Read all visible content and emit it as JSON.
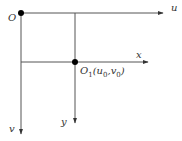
{
  "diagram": {
    "type": "coordinate-systems",
    "colors": {
      "axis": "#555555",
      "point": "#000000",
      "label": "#333333"
    },
    "labels": {
      "origin_O": "O",
      "axis_u": "u",
      "axis_v": "v",
      "axis_x": "x",
      "axis_y": "y",
      "origin_O1_main": "O",
      "origin_O1_sub": "1",
      "origin_O1_coord_open": "(u",
      "origin_O1_coord_u_sub": "0",
      "origin_O1_coord_sep": ",v",
      "origin_O1_coord_v_sub": "0",
      "origin_O1_coord_close": ")"
    },
    "points": {
      "O": {
        "x": 21,
        "y": 13
      },
      "O1": {
        "x": 75,
        "y": 62
      }
    }
  }
}
